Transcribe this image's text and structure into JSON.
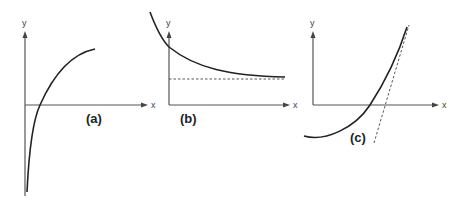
{
  "figure": {
    "panels": [
      {
        "id": "a",
        "label": "(a)",
        "x_axis_label": "x",
        "y_axis_label": "y",
        "description": "Increasing concave curve rising steeply from below the x-axis, crossing it, and leveling off"
      },
      {
        "id": "b",
        "label": "(b)",
        "x_axis_label": "x",
        "y_axis_label": "y",
        "description": "Decreasing convex curve approaching a dashed horizontal asymptote"
      },
      {
        "id": "c",
        "label": "(c)",
        "x_axis_label": "x",
        "y_axis_label": "y",
        "description": "Increasing convex curve with a dashed tangent line near the top"
      }
    ]
  }
}
